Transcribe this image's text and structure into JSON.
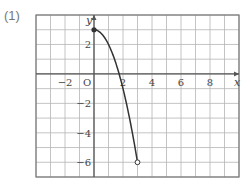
{
  "problem_label": "(1)",
  "colors": {
    "grid": "#b5b5b5",
    "axis": "#555555",
    "curve": "#333333",
    "border": "#777777"
  },
  "chart_data": {
    "type": "line",
    "title": "",
    "xlabel": "x",
    "ylabel": "y",
    "origin_label": "O",
    "xlim": [
      -4,
      10
    ],
    "ylim": [
      -7,
      4
    ],
    "grid": true,
    "x_tick_labels": [
      {
        "value": -2,
        "label": "−2"
      },
      {
        "value": 2,
        "label": "2"
      },
      {
        "value": 4,
        "label": "4"
      },
      {
        "value": 6,
        "label": "6"
      },
      {
        "value": 8,
        "label": "8"
      }
    ],
    "y_tick_labels": [
      {
        "value": 2,
        "label": "2"
      },
      {
        "value": -2,
        "label": "−2"
      },
      {
        "value": -4,
        "label": "−4"
      },
      {
        "value": -6,
        "label": "−6"
      }
    ],
    "series": [
      {
        "name": "y = -x^2 + 3 (0 ≤ x < 3)",
        "x": [
          0,
          0.5,
          1,
          1.5,
          2,
          2.5,
          3
        ],
        "y": [
          3,
          2.75,
          2,
          0.75,
          -1,
          -3.25,
          -6
        ],
        "start_point": {
          "x": 0,
          "y": 3,
          "style": "filled"
        },
        "end_point": {
          "x": 3,
          "y": -6,
          "style": "open"
        }
      }
    ]
  }
}
